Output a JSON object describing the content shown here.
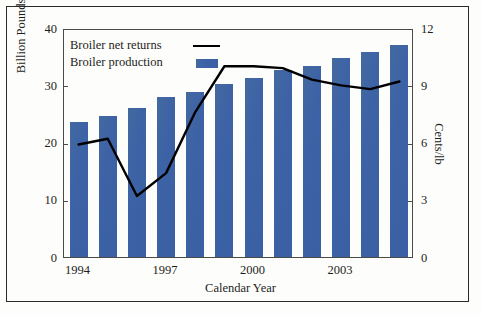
{
  "chart_data": {
    "type": "bar",
    "title": "",
    "subtitle": "",
    "xlabel": "Calendar Year",
    "ylabel": "Billion Pounds",
    "y2label": "Cents/lb",
    "grid": false,
    "legend_position": "top-left",
    "categories": [
      "1994",
      "1995",
      "1996",
      "1997",
      "1998",
      "1999",
      "2000",
      "2001",
      "2002",
      "2003",
      "2004",
      "2005"
    ],
    "x_tick_labels": [
      "1994",
      "1997",
      "2000",
      "2003"
    ],
    "x_tick_categories": [
      "1994",
      "1997",
      "2000",
      "2003"
    ],
    "ylim": [
      0,
      40
    ],
    "y_ticks": [
      "0",
      "10",
      "20",
      "30",
      "40"
    ],
    "y2lim": [
      0,
      12
    ],
    "y2_ticks": [
      "0",
      "3",
      "6",
      "9",
      "12"
    ],
    "series": [
      {
        "name": "Broiler production",
        "type": "bar",
        "axis": "left",
        "units": "Billion Pounds",
        "color": "#3a62a8",
        "values": [
          23.6,
          24.7,
          26.1,
          27.9,
          28.9,
          30.2,
          31.3,
          32.7,
          33.3,
          34.7,
          35.8,
          37.0
        ]
      },
      {
        "name": "Broiler net returns",
        "type": "line",
        "axis": "right",
        "units": "Cents/lb",
        "color": "#000000",
        "values": [
          6.0,
          6.3,
          3.3,
          4.5,
          7.7,
          10.1,
          10.1,
          10.0,
          9.4,
          9.1,
          8.9,
          9.3
        ]
      }
    ]
  },
  "legend": {
    "items": [
      {
        "label": "Broiler net returns",
        "swatch": "line-swatch"
      },
      {
        "label": "Broiler production",
        "swatch": "bar-swatch"
      }
    ]
  },
  "colors": {
    "bar": "#3a62a8",
    "line": "#000000",
    "axis": "#4a4a48",
    "text": "#1d1d1b",
    "background": "#fdfdfb"
  }
}
